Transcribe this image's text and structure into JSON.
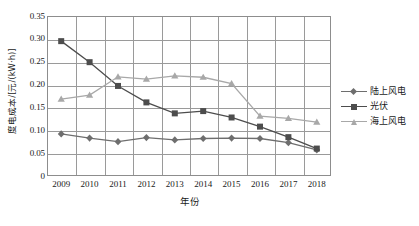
{
  "chart_data": {
    "type": "line",
    "title": "",
    "xlabel": "年份",
    "ylabel": "度电成本/[元/(kW·h)]",
    "categories": [
      "2009",
      "2010",
      "2011",
      "2012",
      "2013",
      "2014",
      "2015",
      "2016",
      "2017",
      "2018"
    ],
    "x": [
      2009,
      2010,
      2011,
      2012,
      2013,
      2014,
      2015,
      2016,
      2017,
      2018
    ],
    "ylim": [
      0,
      0.35
    ],
    "yticks": [
      "0",
      "0.05",
      "0.10",
      "0.15",
      "0.20",
      "0.25",
      "0.30",
      "0.35"
    ],
    "ytick_values": [
      0,
      0.05,
      0.1,
      0.15,
      0.2,
      0.25,
      0.3,
      0.35
    ],
    "grid": true,
    "legend_position": "right",
    "series": [
      {
        "name": "陆上风电",
        "marker": "diamond",
        "color": "#6e6e6e",
        "values": [
          0.092,
          0.083,
          0.075,
          0.084,
          0.079,
          0.082,
          0.083,
          0.082,
          0.073,
          0.057
        ]
      },
      {
        "name": "光伏",
        "marker": "square",
        "color": "#4d4d4d",
        "values": [
          0.295,
          0.249,
          0.197,
          0.161,
          0.137,
          0.142,
          0.128,
          0.108,
          0.085,
          0.06
        ]
      },
      {
        "name": "海上风电",
        "marker": "triangle",
        "color": "#a8a8a8",
        "values": [
          0.168,
          0.177,
          0.217,
          0.212,
          0.219,
          0.216,
          0.202,
          0.131,
          0.126,
          0.118
        ]
      }
    ]
  },
  "axis": {
    "frame_color": "#8d8d8d",
    "grid_color": "#9a9a9a"
  }
}
